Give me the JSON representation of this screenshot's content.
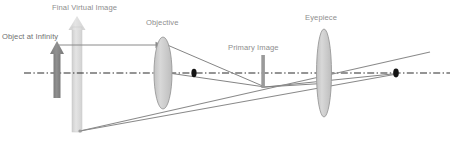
{
  "diagram": {
    "title_caption": "",
    "labels": {
      "final_virtual_image": "Final Virtual Image",
      "object_at_infinity": "Object at Infinity",
      "objective": "Objective",
      "primary_image": "Primary Image",
      "eyepiece": "Eyepiece"
    },
    "colors": {
      "background": "#ffffff",
      "label_text": "#8e8e8e",
      "lens_fill": "#d0d0d0",
      "lens_stroke": "#9a9a9a",
      "object_arrow": "#878787",
      "virtual_image_arrow": "#d9d9d9",
      "axis": "#2b2b2b",
      "ray": "#7d7d7d",
      "focal_dot": "#141414",
      "primary_image_bar": "#9a9a9a"
    },
    "optical_axis": {
      "style": "dash-dot",
      "y": 73,
      "x_start": 24,
      "x_end": 450
    },
    "elements": [
      {
        "name": "object-arrow",
        "type": "arrow",
        "direction": "up",
        "x": 57,
        "y_tail": 98,
        "y_head": 42,
        "fill": "#878787"
      },
      {
        "name": "virtual-image-arrow",
        "type": "arrow",
        "direction": "up",
        "x": 77,
        "y_tail": 132,
        "y_head": 17,
        "fill": "#d9d9d9"
      },
      {
        "name": "objective-lens",
        "type": "biconvex-lens",
        "cx": 163,
        "cy": 73,
        "rx": 9,
        "ry": 36
      },
      {
        "name": "eyepiece-lens",
        "type": "biconvex-lens",
        "cx": 324,
        "cy": 73,
        "rx": 7.5,
        "ry": 44
      },
      {
        "name": "primary-image-bar",
        "type": "vertical-bar",
        "x": 263,
        "y_top": 55,
        "y_bottom": 88
      },
      {
        "name": "focal-dot-objective",
        "type": "dot",
        "cx": 194,
        "cy": 73
      },
      {
        "name": "focal-dot-exit",
        "type": "dot",
        "cx": 396,
        "cy": 73
      }
    ],
    "rays": [
      {
        "name": "incoming-parallel-ray",
        "from": [
          59,
          45
        ],
        "to": [
          160,
          45
        ],
        "arrowhead": true
      },
      {
        "name": "objective-upper-ray",
        "from": [
          164,
          44
        ],
        "to": [
          264,
          87
        ]
      },
      {
        "name": "objective-lower-ray",
        "from": [
          164,
          73
        ],
        "to": [
          264,
          87
        ]
      },
      {
        "name": "eyepiece-ray-upper",
        "from": [
          264,
          87
        ],
        "to": [
          396,
          58
        ]
      },
      {
        "name": "eyepiece-ray-lower",
        "from": [
          264,
          87
        ],
        "to": [
          396,
          74
        ]
      },
      {
        "name": "virtual-ray-upper",
        "from": [
          79,
          131
        ],
        "to": [
          396,
          57
        ]
      },
      {
        "name": "virtual-ray-lower",
        "from": [
          79,
          131
        ],
        "to": [
          396,
          74
        ]
      }
    ]
  }
}
